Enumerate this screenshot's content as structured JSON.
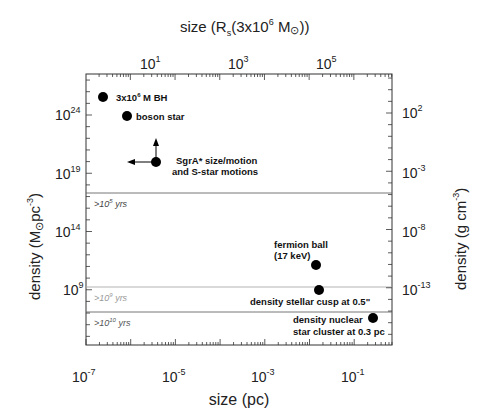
{
  "chart_data": {
    "type": "scatter",
    "title": "",
    "xlabel": "size (pc)",
    "ylabel": "density (M⊙pc⁻³)",
    "x2label": "size (Rs(3x10^6 M⊙))",
    "y2label": "density (g cm⁻³)",
    "xscale": "log",
    "yscale": "log",
    "xlim": [
      1e-07,
      0.7
    ],
    "ylim": [
      20000.0,
      3e+27
    ],
    "grid": false,
    "x_ticks": [
      "10^-7",
      "10^-5",
      "10^-3",
      "10^-1"
    ],
    "y_ticks": [
      "10^9",
      "10^14",
      "10^19",
      "10^24"
    ],
    "x2_ticks": [
      "10^1",
      "10^3",
      "10^5"
    ],
    "y2_ticks": [
      "10^-13",
      "10^-8",
      "10^-3",
      "10^2"
    ],
    "points": [
      {
        "name": "3x10^6 M BH",
        "x": 2.5e-07,
        "y": 3e+25
      },
      {
        "name": "boson star",
        "x": 8e-07,
        "y": 8e+23
      },
      {
        "name": "SgrA* size/motion and S-star motions",
        "x": 3.7e-06,
        "y": 1e+20,
        "upper_limit_arrows": true
      },
      {
        "name": "fermion ball (17 keV)",
        "x": 0.014,
        "y": 100000000000.0
      },
      {
        "name": "density stellar cusp at 0.5\"",
        "x": 0.016,
        "y": 800000000.0
      },
      {
        "name": "density nuclear star cluster at 0.3 pc",
        "x": 0.26,
        "y": 3000000.0
      }
    ],
    "horizontal_lines": [
      {
        "y": 2.5e+17,
        "label": ">10^5 yrs",
        "color": "#555555"
      },
      {
        "y": 1800000000.0,
        "label": ">10^9 yrs",
        "color": "#9a9a9a"
      },
      {
        "y": 13000000.0,
        "label": ">10^10 yrs",
        "color": "#555555"
      }
    ]
  },
  "labels": {
    "top_axis_title": "size (R",
    "top_axis_sub": "s",
    "top_axis_rest": "(3x10",
    "top_axis_sup": "6",
    "top_axis_end": " M",
    "top_axis_close": "))",
    "bottom_axis_title": "size (pc)",
    "left_axis_title": "density (M",
    "left_axis_unit": "pc",
    "left_axis_sup": "-3",
    "right_axis_title": "density (g cm",
    "right_axis_sup": "-3",
    "right_axis_close": ")",
    "bh_a": "3x10",
    "bh_sup": "6",
    "bh_b": " M   BH",
    "boson": "boson star",
    "sgra_1": "SgrA* size/motion",
    "sgra_2": "and S-star motions",
    "fermion_1": "fermion ball",
    "fermion_2": "(17 keV)",
    "cusp": "density stellar cusp at 0.5\"",
    "nsc_1": "density nuclear",
    "nsc_2": "star cluster at 0.3 pc",
    "line1_a": ">10",
    "line1_sup": "5",
    "line1_b": " yrs",
    "line2_a": ">10",
    "line2_sup": "9",
    "line2_b": " yrs",
    "line3_a": ">10",
    "line3_sup": "10",
    "line3_b": " yrs",
    "ten": "10",
    "xb": [
      "-7",
      "-5",
      "-3",
      "-1"
    ],
    "xt": [
      "1",
      "3",
      "5"
    ],
    "yl": [
      "24",
      "19",
      "14",
      "9"
    ],
    "yr": [
      "2",
      "-3",
      "-8",
      "-13"
    ]
  }
}
